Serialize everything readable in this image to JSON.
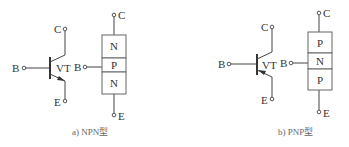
{
  "diagrams": [
    {
      "id": "npn",
      "caption": "a) NPN型",
      "symbol": {
        "collector": "C",
        "base": "B",
        "emitter": "E",
        "designator": "VT"
      },
      "structure": {
        "collector": "C",
        "base": "B",
        "emitter": "E",
        "layers": [
          "N",
          "P",
          "N"
        ]
      }
    },
    {
      "id": "pnp",
      "caption": "b) PNP型",
      "symbol": {
        "collector": "C",
        "base": "B",
        "emitter": "E",
        "designator": "VT"
      },
      "structure": {
        "collector": "C",
        "base": "B",
        "emitter": "E",
        "layers": [
          "P",
          "N",
          "P"
        ]
      }
    }
  ]
}
